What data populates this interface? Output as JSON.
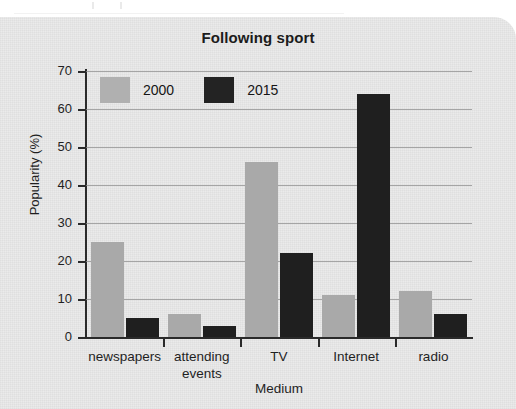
{
  "chart_data": {
    "type": "bar",
    "title": "Following sport",
    "xlabel": "Medium",
    "ylabel": "Popularity (%)",
    "categories": [
      "newspapers",
      "attending events",
      "TV",
      "Internet",
      "radio"
    ],
    "category_lines": [
      [
        "newspapers"
      ],
      [
        "attending",
        "events"
      ],
      [
        "TV"
      ],
      [
        "Internet"
      ],
      [
        "radio"
      ]
    ],
    "series": [
      {
        "name": "2000",
        "color": "#a9a9a9",
        "values": [
          25,
          6,
          46,
          11,
          12
        ]
      },
      {
        "name": "2015",
        "color": "#1f1f1f",
        "values": [
          5,
          3,
          22,
          64,
          6
        ]
      }
    ],
    "ylim": [
      0,
      70
    ],
    "yticks": [
      0,
      10,
      20,
      30,
      40,
      50,
      60,
      70
    ],
    "ytick_labels": [
      "0",
      "10",
      "20",
      "30",
      "40",
      "50",
      "60",
      "70"
    ],
    "grid": true,
    "legend_position": "top-left-inside"
  },
  "legend": {
    "items": [
      {
        "label": "2000",
        "color": "#a9a9a9"
      },
      {
        "label": "2015",
        "color": "#1f1f1f"
      }
    ]
  }
}
